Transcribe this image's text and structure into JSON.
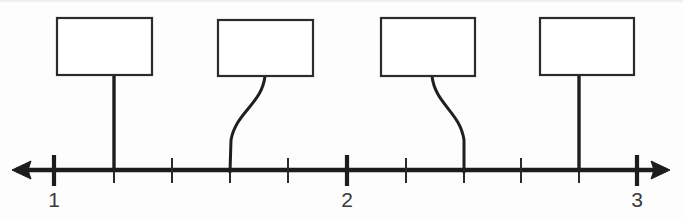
{
  "diagram": {
    "type": "number-line",
    "background_color": "#fdfdfd",
    "ink_color": "#1c1c1c",
    "axis": {
      "y": 170,
      "x_start": 12,
      "x_end": 670,
      "stroke_width": 4.4,
      "left_arrow": true,
      "right_arrow": true
    },
    "labels": [
      {
        "text": "1",
        "x": 54,
        "y": 207
      },
      {
        "text": "2",
        "x": 347,
        "y": 207
      },
      {
        "text": "3",
        "x": 637,
        "y": 207
      }
    ],
    "major_ticks": [
      {
        "x": 54,
        "value": "1"
      },
      {
        "x": 347,
        "value": "2"
      },
      {
        "x": 637,
        "value": "3"
      }
    ],
    "minor_ticks": [
      {
        "x": 114
      },
      {
        "x": 172
      },
      {
        "x": 230
      },
      {
        "x": 288
      },
      {
        "x": 406
      },
      {
        "x": 464
      },
      {
        "x": 521
      },
      {
        "x": 579
      }
    ],
    "tick_interval_px": 58,
    "subdivisions_per_unit": 5,
    "boxes": [
      {
        "id": "box-1",
        "content": "",
        "x": 57,
        "y": 18,
        "width": 95,
        "height": 57,
        "stem_type": "straight",
        "stem_top_x": 114,
        "stem_bottom_x": 114,
        "marks_value": "1.2"
      },
      {
        "id": "box-2",
        "content": "",
        "x": 218,
        "y": 20,
        "width": 95,
        "height": 56,
        "stem_type": "curved",
        "stem_top_x": 265,
        "stem_bottom_x": 230,
        "marks_value": "1.6"
      },
      {
        "id": "box-3",
        "content": "",
        "x": 381,
        "y": 18,
        "width": 94,
        "height": 58,
        "stem_type": "curved",
        "stem_top_x": 432,
        "stem_bottom_x": 464,
        "marks_value": "2.4"
      },
      {
        "id": "box-4",
        "content": "",
        "x": 540,
        "y": 18,
        "width": 94,
        "height": 57,
        "stem_type": "straight",
        "stem_top_x": 579,
        "stem_bottom_x": 579,
        "marks_value": "2.8"
      }
    ]
  }
}
